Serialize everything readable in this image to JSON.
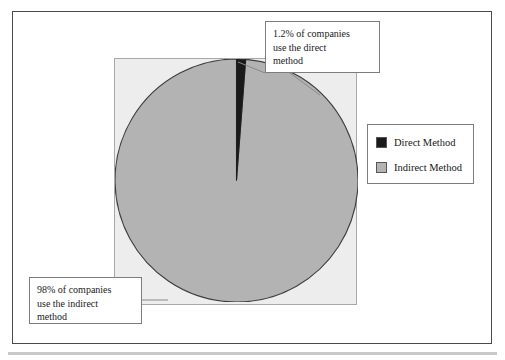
{
  "figure": {
    "background_color": "#ffffff",
    "frame_color": "#4a4a4a",
    "plot_background_color": "#ededed",
    "bottom_rule_color": "#c9c9c9"
  },
  "legend": {
    "position": "right",
    "items": [
      {
        "label": "Direct Method",
        "color": "#1a1a1a",
        "swatch_name": "legend-swatch-direct"
      },
      {
        "label": "Indirect Method",
        "color": "#b3b3b3",
        "swatch_name": "legend-swatch-indirect"
      }
    ]
  },
  "callouts": {
    "direct": {
      "lines": [
        "1.2% of companies",
        "use the direct",
        "method"
      ],
      "target": "Direct Method slice"
    },
    "indirect": {
      "lines": [
        "98% of companies",
        "use the indirect",
        "method"
      ],
      "target": "Indirect Method slice"
    }
  },
  "chart_data": {
    "type": "pie",
    "title": "",
    "subtitle": "",
    "xlabel": "",
    "ylabel": "",
    "grid": false,
    "legend_position": "right",
    "start_angle_deg": 90,
    "direction": "clockwise",
    "categories": [
      "Direct Method",
      "Indirect Method"
    ],
    "values": [
      1.2,
      98.0
    ],
    "value_unit": "% of companies",
    "colors": [
      "#1a1a1a",
      "#b3b3b3"
    ],
    "slice_outline_color": "#3d3d3d",
    "annotations": [
      "1.2% of companies use the direct method",
      "98% of companies use the indirect method"
    ]
  }
}
